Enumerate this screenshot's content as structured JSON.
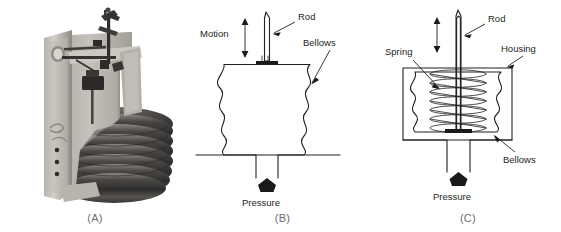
{
  "figure": {
    "background_color": "#ffffff",
    "line_color": "#231f20",
    "caption_color": "#6d6e71"
  },
  "panels": [
    {
      "id": "A",
      "caption": "(A)",
      "type": "photograph",
      "subject": "bellows-assembly-photo",
      "description": "Grayscale photograph of a metal bellows element mounted in a cast bracket with lever linkage",
      "photo_colors": {
        "bracket_light": "#c9c6c0",
        "bracket_mid": "#a8a49d",
        "bracket_shadow": "#6f6c66",
        "bellows_dark": "#3b3a38",
        "bellows_mid": "#777470",
        "linkage_dark": "#2b2a28"
      },
      "bellows_ring_count": 7
    },
    {
      "id": "B",
      "caption": "(B)",
      "type": "line-diagram",
      "subject": "plain-bellows-diagram",
      "labels": [
        {
          "name": "motion",
          "text": "Motion"
        },
        {
          "name": "rod",
          "text": "Rod"
        },
        {
          "name": "bellows",
          "text": "Bellows"
        },
        {
          "name": "pressure",
          "text": "Pressure"
        }
      ],
      "convolution_count": 4
    },
    {
      "id": "C",
      "caption": "(C)",
      "type": "line-diagram",
      "subject": "spring-opposed-bellows-diagram",
      "labels": [
        {
          "name": "spring",
          "text": "Spring"
        },
        {
          "name": "rod",
          "text": "Rod"
        },
        {
          "name": "housing",
          "text": "Housing"
        },
        {
          "name": "bellows",
          "text": "Bellows"
        },
        {
          "name": "pressure",
          "text": "Pressure"
        }
      ],
      "convolution_count": 4,
      "spring_coil_count": 7
    }
  ]
}
